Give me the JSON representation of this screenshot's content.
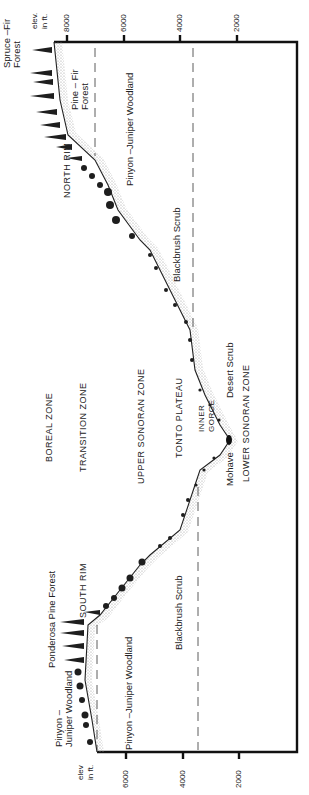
{
  "diagram": {
    "orientation": "rotated -90deg",
    "axis": {
      "label": "elev. in ft.",
      "ticks_top": [
        "8000",
        "6000",
        "4000",
        "2000"
      ],
      "ticks_bottom": [
        "6000",
        "4000",
        "2000"
      ]
    },
    "zones": {
      "boreal": "BOREAL ZONE",
      "transition": "TRANSITION ZONE",
      "upper_sonoran": "UPPER SONORAN ZONE",
      "lower_sonoran": "LOWER SONORAN ZONE"
    },
    "landmarks": {
      "north_rim": "NORTH RIM",
      "south_rim": "SOUTH RIM",
      "tonto_plateau": "TONTO PLATEAU",
      "inner_gorge": "INNER\nGORGE"
    },
    "vegetation": {
      "spruce_fir": "Spruce –Fir\nForest",
      "pine_fir": "Pine – Fir\nForest",
      "pinyon_juniper_north": "Pinyon –Juniper Woodland",
      "blackbrush_north": "Blackbrush Scrub",
      "desert_scrub": "Desert Scrub",
      "mohave": "Mohave",
      "blackbrush_south": "Blackbrush Scrub",
      "pinyon_juniper_south_inner": "Pinyon –Juniper Woodland",
      "ponderosa": "Ponderosa Pine Forest",
      "pinyon_juniper_south_outer": "Pinyon –\nJuniper Woodland"
    },
    "axis_labels": {
      "top": "elev.\nin ft.",
      "bottom": "elev\nin ft."
    },
    "colors": {
      "frame": "#111111",
      "profile": "#222222",
      "stipple": "#bdbdbd",
      "tree": "#1e1e1e"
    }
  }
}
